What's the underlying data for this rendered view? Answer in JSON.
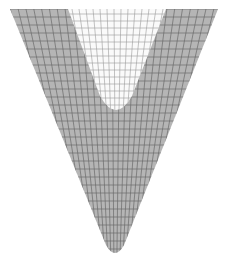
{
  "figure": {
    "colors": {
      "background": "#ffffff",
      "solid_fill": "#b5b5b5",
      "solid_mesh_line": "#6a6a6a",
      "notch_fill": "#fafafa",
      "notch_mesh_line": "#9a9a9a"
    },
    "geometry": {
      "outer": {
        "top_y": 9,
        "top_left_x": 10,
        "top_right_x": 218,
        "tip_x": 115,
        "tip_y": 259
      },
      "notch": {
        "top_left_x": 68,
        "top_right_x": 166,
        "bottom_x": 116,
        "bottom_y": 118
      },
      "mesh": {
        "columns": 26,
        "rows": 32
      }
    }
  }
}
